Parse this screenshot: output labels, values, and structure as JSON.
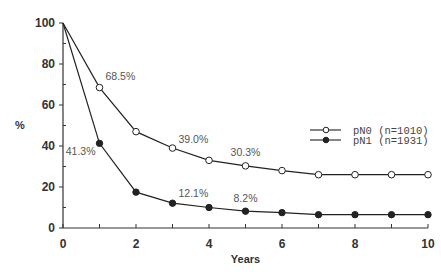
{
  "chart_data": {
    "type": "line",
    "title": "",
    "xlabel": "Years",
    "ylabel": "%",
    "xlim": [
      0,
      10
    ],
    "ylim": [
      0,
      100
    ],
    "x_ticks": [
      0,
      2,
      4,
      6,
      8,
      10
    ],
    "y_ticks": [
      0,
      20,
      40,
      60,
      80,
      100
    ],
    "grid": false,
    "legend_position": "right",
    "x": [
      0,
      1,
      2,
      3,
      4,
      5,
      6,
      7,
      8,
      9,
      10
    ],
    "series": [
      {
        "name": "pN0 (n=1010)",
        "marker": "open-circle",
        "values": [
          100,
          68.5,
          47,
          39.0,
          33,
          30.3,
          28,
          26,
          26,
          26,
          26
        ]
      },
      {
        "name": "pN1 (n=1931)",
        "marker": "filled-circle",
        "values": [
          100,
          41.3,
          17.5,
          12.1,
          10,
          8.2,
          7.5,
          6.5,
          6.5,
          6.5,
          6.5
        ]
      }
    ],
    "annotations": [
      {
        "series": "pN0 (n=1010)",
        "x": 1,
        "text": "68.5%"
      },
      {
        "series": "pN0 (n=1010)",
        "x": 3,
        "text": "39.0%"
      },
      {
        "series": "pN0 (n=1010)",
        "x": 5,
        "text": "30.3%"
      },
      {
        "series": "pN1 (n=1931)",
        "x": 1,
        "text": "41.3%"
      },
      {
        "series": "pN1 (n=1931)",
        "x": 3,
        "text": "12.1%"
      },
      {
        "series": "pN1 (n=1931)",
        "x": 5,
        "text": "8.2%"
      }
    ]
  },
  "colors": {
    "axis": "#333333",
    "line": "#222222",
    "annotation": "#555555"
  }
}
